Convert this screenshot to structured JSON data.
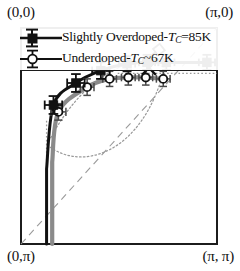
{
  "figure": {
    "kind": "brillouin-zone-quadrant-plot",
    "corner_labels": {
      "top_left": "(0,0)",
      "top_right": "(π,0)",
      "bottom_left": "(0,π)",
      "bottom_right": "(π, π)"
    },
    "colors": {
      "frame": "#1c1c1c",
      "overdoped_curve": "#111111",
      "underdoped_curve": "#8a8a8a",
      "diagonal": "#9a9a9a",
      "lens_dotted": "#9a9a9a",
      "background": "#ffffff"
    }
  },
  "legend": {
    "entries": [
      {
        "marker": "filled-square",
        "label_prefix": "Slightly Overdoped-",
        "label_symbol": "T",
        "label_subscript": "C",
        "label_suffix": "=85K",
        "full_label": "Slightly Overdoped-T_C=85K"
      },
      {
        "marker": "open-circle",
        "label_prefix": "Underdoped-",
        "label_symbol": "T",
        "label_subscript": "C",
        "label_suffix": "~67K",
        "full_label": "Underdoped-T_C~67K"
      }
    ]
  },
  "chart_data": {
    "type": "scatter",
    "title": "",
    "xlabel": "",
    "ylabel": "",
    "xlim": [
      0,
      3.14159
    ],
    "ylim": [
      0,
      3.14159
    ],
    "grid": false,
    "legend_position": "top-left",
    "axis_note": "Axes are momentum-space coordinates; origin (0,0) at top-left, (π,π) at bottom-right",
    "series": [
      {
        "name": "Slightly Overdoped-T_C=85K",
        "marker": "filled-square",
        "color": "#111111",
        "x": [
          0.52,
          0.88,
          1.28,
          1.7,
          2.02,
          2.33,
          2.98
        ],
        "y": [
          1.12,
          0.8,
          0.62,
          0.52,
          0.5,
          0.5,
          0.5
        ],
        "xerr": [
          0.14,
          0.14,
          0.14,
          0.13,
          0.13,
          0.13,
          0.13
        ],
        "yerr": [
          0.13,
          0.13,
          0.12,
          0.11,
          0.11,
          0.11,
          0.11
        ]
      },
      {
        "name": "Underdoped-T_C~67K",
        "marker": "open-circle",
        "color": "#8a8a8a",
        "x": [
          0.6,
          1.06,
          1.42,
          1.72,
          2.0,
          2.28
        ],
        "y": [
          1.22,
          0.86,
          0.74,
          0.72,
          0.72,
          0.74
        ],
        "xerr": [
          0.12,
          0.11,
          0.11,
          0.11,
          0.11,
          0.11
        ],
        "yerr": [
          0.12,
          0.12,
          0.11,
          0.11,
          0.11,
          0.11
        ]
      }
    ],
    "annotations": [
      {
        "name": "zone-diagonal",
        "style": "dashed",
        "from": [
          0,
          3.14159
        ],
        "to": [
          3.14159,
          0
        ]
      },
      {
        "name": "fermi-lens-pocket",
        "style": "dotted",
        "shape": "lens-ellipse"
      },
      {
        "name": "x-marker",
        "style": "x-cross",
        "x": 2.05,
        "y": 0.58
      },
      {
        "name": "tilted-open-bar",
        "style": "open-rectangle-tilted",
        "x": 2.12,
        "y": 0.38
      },
      {
        "name": "dotted-vertical-tail",
        "style": "dotted",
        "x": 0.41
      },
      {
        "name": "dotted-horizontal-tail",
        "style": "dotted",
        "y": 0.66
      }
    ]
  }
}
